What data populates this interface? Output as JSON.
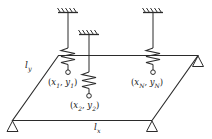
{
  "figure": {
    "type": "mechanical-schematic"
  },
  "plate": {
    "dimension_x_label": "l",
    "dimension_x_sub": "x",
    "dimension_y_label": "l",
    "dimension_y_sub": "y"
  },
  "springs": [
    {
      "id": "spring-1",
      "point_open": "(",
      "x_sym": "x",
      "x_sub": "1",
      "comma": ", ",
      "y_sym": "y",
      "y_sub": "1",
      "point_close": ")"
    },
    {
      "id": "spring-2",
      "point_open": "(",
      "x_sym": "x",
      "x_sub": "2",
      "comma": ", ",
      "y_sym": "y",
      "y_sub": "2",
      "point_close": ")"
    },
    {
      "id": "spring-N",
      "point_open": "(",
      "x_sym": "x",
      "x_sub": "N",
      "comma": ", ",
      "y_sym": "y",
      "y_sub": "N",
      "point_close": ")"
    }
  ],
  "colors": {
    "line": "#2b2b2b",
    "background": "#ffffff"
  }
}
